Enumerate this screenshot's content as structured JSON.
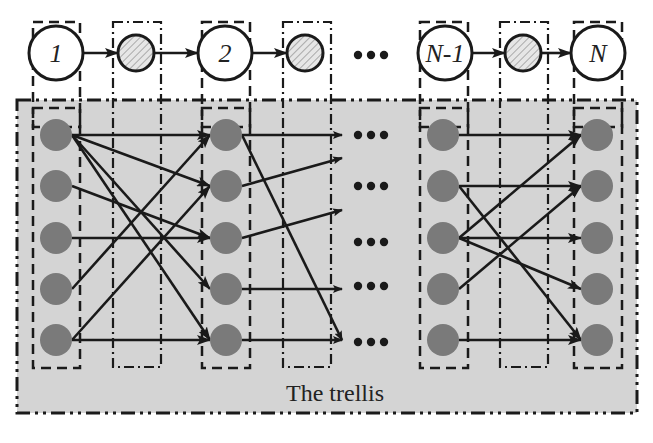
{
  "diagram": {
    "trellis_label": "The trellis",
    "ellipsis": "•••",
    "colors": {
      "background": "#ffffff",
      "trellis_fill": "#d4d4d4",
      "state_fill": "#7a7a7a",
      "line": "#1a1a1a",
      "hatched_fill": "#e6e6e6",
      "hatch_stroke": "#8a8a8a"
    },
    "chain": {
      "nodes": [
        {
          "id": "1",
          "label": "1",
          "type": "observed"
        },
        {
          "id": "h1",
          "label": "",
          "type": "hidden-hatched"
        },
        {
          "id": "2",
          "label": "2",
          "type": "observed"
        },
        {
          "id": "h2",
          "label": "",
          "type": "hidden-hatched"
        },
        {
          "id": "ellipsis",
          "label": "•••",
          "type": "ellipsis"
        },
        {
          "id": "N-1",
          "label": "N-1",
          "type": "observed"
        },
        {
          "id": "h3",
          "label": "",
          "type": "hidden-hatched"
        },
        {
          "id": "N",
          "label": "N",
          "type": "observed"
        }
      ]
    },
    "trellis": {
      "states_per_column": 5,
      "columns": [
        "1",
        "2",
        "N-1",
        "N"
      ],
      "transitions_stage_1": [
        [
          1,
          1
        ],
        [
          1,
          2
        ],
        [
          1,
          4
        ],
        [
          1,
          5
        ],
        [
          2,
          3
        ],
        [
          3,
          3
        ],
        [
          4,
          1
        ],
        [
          5,
          2
        ],
        [
          5,
          5
        ]
      ],
      "transitions_stage_2_outgoing": [
        [
          1,
          1
        ],
        [
          1,
          5
        ],
        [
          2,
          "up"
        ],
        [
          3,
          "up"
        ],
        [
          4,
          4
        ],
        [
          5,
          5
        ]
      ],
      "transitions_last_stage": [
        [
          1,
          1
        ],
        [
          2,
          2
        ],
        [
          2,
          5
        ],
        [
          3,
          1
        ],
        [
          3,
          3
        ],
        [
          3,
          4
        ],
        [
          4,
          2
        ],
        [
          5,
          5
        ]
      ]
    }
  }
}
